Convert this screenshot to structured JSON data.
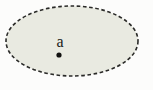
{
  "figure": {
    "kind": "point-in-open-region-diagram",
    "canvas": {
      "width": 153,
      "height": 90,
      "background_color": "#fcfcfb"
    },
    "region": {
      "name": "neighborhood-ellipse",
      "shape": "ellipse",
      "center_x": 72,
      "center_y": 41,
      "radius_x": 66,
      "radius_y": 35,
      "fill_color": "#e9eae1",
      "stroke_color": "#2a2a28",
      "stroke_width": 1.6,
      "border_style": "dashed",
      "dash_length": 3.6,
      "gap_length": 2.6
    },
    "point": {
      "label": "a",
      "label_x": 60,
      "label_y": 47,
      "label_font_size": 16,
      "label_color": "#1a1a18",
      "marker_x": 59,
      "marker_y": 55,
      "marker_radius": 2.6,
      "marker_color": "#121210"
    }
  }
}
